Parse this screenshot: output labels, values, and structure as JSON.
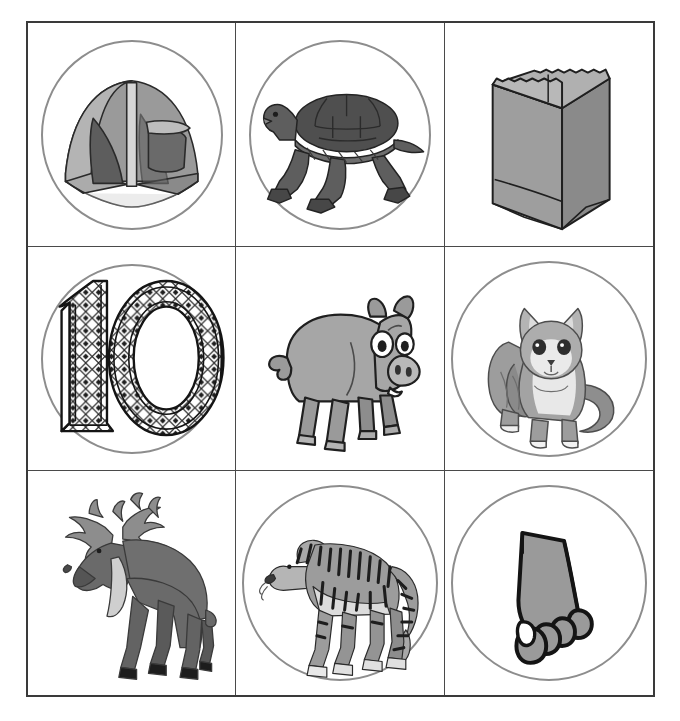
{
  "page": {
    "background_color": "#ffffff",
    "border_color": "#3a3a3a",
    "divider_color": "#4a4a4a",
    "circle_color": "#8d8d8d",
    "rows": 3,
    "columns": 3
  },
  "palette": {
    "outline": "#1f1f1f",
    "mid_gray": "#8f8f8f",
    "light_gray": "#c3c3c3",
    "dark_gray": "#575757",
    "deep_gray": "#3d3d3d",
    "pale": "#e4e4e4",
    "white": "#ffffff"
  },
  "cells": [
    {
      "id": "cell-1",
      "row": 1,
      "col": 1,
      "name": "tent",
      "label": "tent",
      "icon": "tent-icon",
      "has_circle": true,
      "circle_style": "oval"
    },
    {
      "id": "cell-2",
      "row": 1,
      "col": 2,
      "name": "turtle",
      "label": "turtle",
      "icon": "turtle-icon",
      "has_circle": true,
      "circle_style": "oval"
    },
    {
      "id": "cell-3",
      "row": 1,
      "col": 3,
      "name": "bag",
      "label": "paper bag",
      "icon": "bag-icon",
      "has_circle": false,
      "circle_style": "none"
    },
    {
      "id": "cell-4",
      "row": 2,
      "col": 1,
      "name": "ten",
      "label": "10",
      "icon": "number-ten-icon",
      "has_circle": true,
      "circle_style": "oval"
    },
    {
      "id": "cell-5",
      "row": 2,
      "col": 2,
      "name": "pig",
      "label": "pig",
      "icon": "pig-icon",
      "has_circle": false,
      "circle_style": "none"
    },
    {
      "id": "cell-6",
      "row": 2,
      "col": 3,
      "name": "cat",
      "label": "cat",
      "icon": "cat-icon",
      "has_circle": true,
      "circle_style": "round"
    },
    {
      "id": "cell-7",
      "row": 3,
      "col": 1,
      "name": "moose",
      "label": "moose",
      "icon": "moose-icon",
      "has_circle": false,
      "circle_style": "none"
    },
    {
      "id": "cell-8",
      "row": 3,
      "col": 2,
      "name": "tiger",
      "label": "tiger",
      "icon": "tiger-icon",
      "has_circle": true,
      "circle_style": "round"
    },
    {
      "id": "cell-9",
      "row": 3,
      "col": 3,
      "name": "foot",
      "label": "foot",
      "icon": "foot-icon",
      "has_circle": true,
      "circle_style": "round"
    }
  ]
}
